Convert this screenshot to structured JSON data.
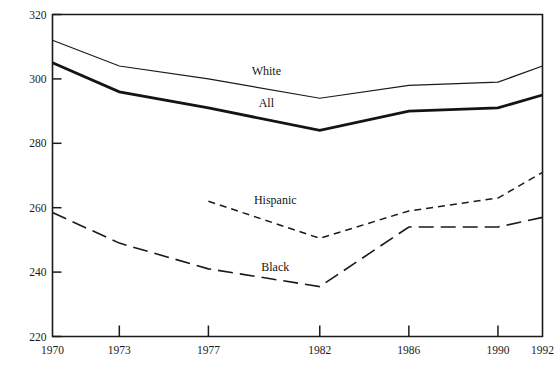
{
  "chart_data": {
    "type": "line",
    "title": "",
    "subtitle": "",
    "xlabel": "",
    "ylabel": "",
    "x": [
      1970,
      1973,
      1977,
      1982,
      1986,
      1990,
      1992
    ],
    "x_tick_labels": [
      "1970",
      "1973",
      "1977",
      "1982",
      "1986",
      "1990",
      "1992"
    ],
    "y_tick_labels": [
      "320",
      "300",
      "280",
      "260",
      "240",
      "220"
    ],
    "y_ticks": [
      320,
      300,
      280,
      260,
      240,
      220
    ],
    "xlim": [
      1970,
      1992
    ],
    "ylim": [
      220,
      320
    ],
    "grid": false,
    "legend_position": "inline-annotations",
    "series": [
      {
        "name": "White",
        "label": "White",
        "line_style": "solid",
        "line_width": 1.2,
        "color": "#1a1a1a",
        "x": [
          1970,
          1973,
          1977,
          1982,
          1986,
          1990,
          1992
        ],
        "values": [
          312,
          304,
          300,
          294,
          298,
          299,
          304
        ],
        "label_x": 1979.6,
        "label_y": 302.5
      },
      {
        "name": "All",
        "label": "All",
        "line_style": "solid",
        "line_width": 2.8,
        "color": "#141414",
        "x": [
          1970,
          1973,
          1977,
          1982,
          1986,
          1990,
          1992
        ],
        "values": [
          305,
          296,
          291,
          284,
          290,
          291,
          295
        ],
        "label_x": 1979.6,
        "label_y": 292.5
      },
      {
        "name": "Hispanic",
        "label": "Hispanic",
        "line_style": "dashed-short",
        "line_width": 1.5,
        "color": "#1a1a1a",
        "x": [
          1977,
          1982,
          1986,
          1990,
          1992
        ],
        "values": [
          262,
          250.5,
          259,
          263,
          271
        ],
        "label_x": 1980.0,
        "label_y": 262.5
      },
      {
        "name": "Black",
        "label": "Black",
        "line_style": "dashed-long",
        "line_width": 1.6,
        "color": "#1a1a1a",
        "x": [
          1970,
          1973,
          1977,
          1982,
          1986,
          1990,
          1992
        ],
        "values": [
          258.5,
          249,
          241,
          235.5,
          254,
          254,
          257
        ],
        "label_x": 1980.0,
        "label_y": 241.5
      }
    ]
  },
  "axes": {
    "frame_color": "#1a1a1a"
  }
}
